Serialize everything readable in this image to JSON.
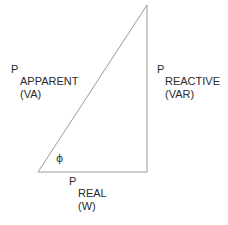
{
  "diagram": {
    "background_color": "#ffffff",
    "line_color": "#9a9a9a",
    "text_color": "#2a2a2a",
    "angle": {
      "symbol": "ϕ",
      "name": "phi"
    },
    "sides": {
      "apparent": {
        "symbol": "P",
        "name": "APPARENT",
        "unit": "(VA)"
      },
      "reactive": {
        "symbol": "P",
        "name": "REACTIVE",
        "unit": "(VAR)"
      },
      "real": {
        "symbol": "P",
        "name": "REAL",
        "unit": "(W)"
      }
    },
    "geometry": {
      "apex": [
        147,
        5
      ],
      "bottom_left": [
        38,
        172
      ],
      "bottom_right": [
        147,
        172
      ]
    }
  }
}
